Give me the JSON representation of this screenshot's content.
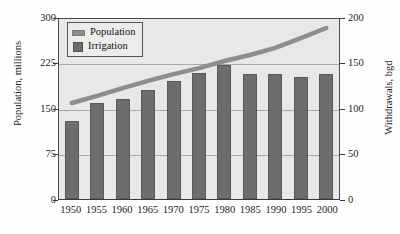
{
  "chart_data": {
    "type": "bar",
    "title": "",
    "subtitle": "",
    "xlabel": "",
    "ylabel": "Population, millions",
    "y2label": "Withdrawals, bgd",
    "categories": [
      "1950",
      "1955",
      "1960",
      "1965",
      "1970",
      "1975",
      "1980",
      "1985",
      "1990",
      "1995",
      "2000"
    ],
    "ylim": [
      0,
      300
    ],
    "y2lim": [
      0,
      200
    ],
    "yticks": [
      "0",
      "75",
      "150",
      "225",
      "300"
    ],
    "y2ticks": [
      "0",
      "50",
      "100",
      "150",
      "200"
    ],
    "grid": true,
    "legend_position": "top-left",
    "series": [
      {
        "name": "Irrigation",
        "type": "bar",
        "axis": "right",
        "unit": "bgd",
        "color": "#6d6d6d",
        "values": [
          86,
          105,
          110,
          120,
          130,
          138,
          147,
          137,
          137,
          134,
          137
        ]
      },
      {
        "name": "Population",
        "type": "line",
        "axis": "left",
        "unit": "millions",
        "color": "#8d8d8d",
        "values": [
          160,
          172,
          185,
          197,
          208,
          218,
          230,
          240,
          252,
          268,
          285
        ]
      }
    ]
  },
  "legend": {
    "items": [
      {
        "label": "Population",
        "marker": "line-swatch"
      },
      {
        "label": "Irrigation",
        "marker": "box-swatch"
      }
    ]
  }
}
